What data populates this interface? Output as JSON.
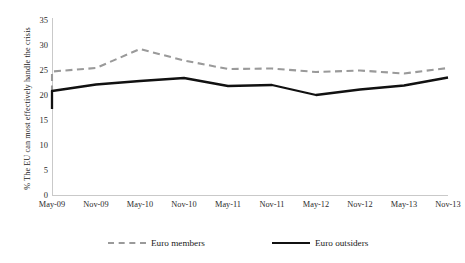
{
  "chart_data": {
    "type": "line",
    "title": "",
    "xlabel": "",
    "ylabel": "% The EU can most effectively handle the crisis",
    "ylim": [
      0,
      35
    ],
    "ytick_values": [
      0,
      5,
      10,
      15,
      20,
      25,
      30,
      35
    ],
    "ytick_labels": [
      "0",
      "5",
      "10",
      "15",
      "20",
      "25",
      "30",
      "35"
    ],
    "grid": false,
    "legend_position": "bottom",
    "categories": [
      "May-09",
      "Nov-09",
      "May-10",
      "Nov-10",
      "May-11",
      "Nov-11",
      "May-12",
      "Nov-12",
      "May-13",
      "Nov-13"
    ],
    "x_positions_note": "10 category ticks; each series additionally carries a half-step leading point at the y-axis",
    "series": [
      {
        "name": "Euro members",
        "style": "dashed",
        "color": "#9a9a9a",
        "lead_value": 20.6,
        "values": [
          24.8,
          25.5,
          29.3,
          27.0,
          25.3,
          25.4,
          24.7,
          25.0,
          24.4,
          25.5
        ]
      },
      {
        "name": "Euro outsiders",
        "style": "solid",
        "color": "#111111",
        "lead_value": 17.3,
        "values": [
          20.9,
          22.2,
          22.9,
          23.5,
          21.9,
          22.1,
          20.1,
          21.2,
          22.0,
          23.6
        ]
      }
    ]
  },
  "legend": {
    "items": [
      {
        "label": "Euro members"
      },
      {
        "label": "Euro outsiders"
      }
    ]
  },
  "axis": {
    "y_title": "% The EU can most effectively handle the crisis"
  }
}
